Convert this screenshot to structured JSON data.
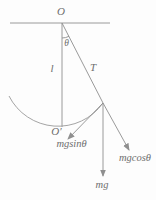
{
  "figure": {
    "labels": {
      "pivot": "O",
      "angle": "θ",
      "length": "l",
      "tension": "T",
      "lowest_point": "O′",
      "tangential_component": "mgsinθ",
      "weight": "mg",
      "radial_component": "mgcosθ"
    },
    "colors": {
      "line": "#8f8f8f",
      "text": "#6e6e6e",
      "background": "#fdfdfd"
    }
  }
}
